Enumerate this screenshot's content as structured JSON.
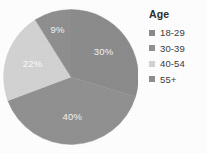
{
  "chart_data": {
    "type": "pie",
    "title": "",
    "legend_title": "Age",
    "legend_position": "right",
    "categories": [
      "18-29",
      "30-39",
      "40-54",
      "55+"
    ],
    "values": [
      30,
      40,
      22,
      9
    ],
    "labels": [
      "30%",
      "40%",
      "22%",
      "9%"
    ],
    "units": "percent",
    "colors": [
      "#8b8b8b",
      "#909090",
      "#d2d2d2",
      "#8e8e8e"
    ],
    "slices": [
      {
        "label": "30%",
        "value": 30,
        "category": "18-29",
        "color": "#8b8b8b",
        "label_fill": "#f2f2f2"
      },
      {
        "label": "40%",
        "value": 40,
        "category": "30-39",
        "color": "#909090",
        "label_fill": "#f2f2f2"
      },
      {
        "label": "22%",
        "value": 22,
        "category": "40-54",
        "color": "#d2d2d2",
        "label_fill": "#fafafa"
      },
      {
        "label": "9%",
        "value": 9,
        "category": "55+",
        "color": "#8e8e8e",
        "label_fill": "#f2f2f2"
      }
    ]
  },
  "legend": {
    "title": "Age",
    "items": [
      {
        "label": "18-29",
        "color": "#8b8b8b"
      },
      {
        "label": "30-39",
        "color": "#909090"
      },
      {
        "label": "40-54",
        "color": "#d2d2d2"
      },
      {
        "label": "55+",
        "color": "#8e8e8e"
      }
    ]
  },
  "colors": {
    "background": "#fefefe",
    "text": "#3a3a3a",
    "title_text": "#2b2b2b",
    "slice_label_text": "#f2f2f2"
  }
}
